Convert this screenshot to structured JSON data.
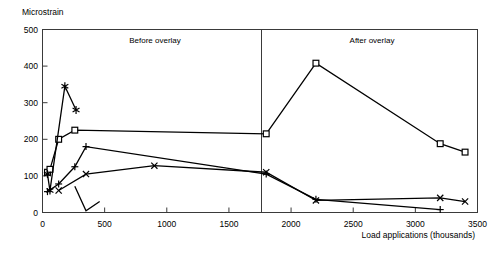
{
  "chart_data": {
    "type": "line",
    "title": "",
    "ylabel": "Microstrain",
    "xlabel": "Load applications (thousands)",
    "xlim": [
      0,
      3500
    ],
    "ylim": [
      0,
      500
    ],
    "xticks": [
      0,
      500,
      1000,
      1500,
      2000,
      2500,
      3000,
      3500
    ],
    "yticks": [
      0,
      100,
      200,
      300,
      400,
      500
    ],
    "grid": false,
    "legend": "none",
    "annotations": [
      {
        "text": "Before overlay",
        "x": 900,
        "y": 470
      },
      {
        "text": "After overlay",
        "x": 2650,
        "y": 470
      }
    ],
    "divider_x": 1800,
    "series": [
      {
        "name": "series-square",
        "marker": "square",
        "x": [
          40,
          60,
          130,
          260,
          1800,
          2200,
          3200,
          3400
        ],
        "y": [
          110,
          118,
          200,
          225,
          215,
          408,
          188,
          165
        ]
      },
      {
        "name": "series-asterisk",
        "marker": "asterisk",
        "x": [
          40,
          60,
          180,
          270
        ],
        "y": [
          105,
          60,
          345,
          280
        ]
      },
      {
        "name": "series-plus",
        "marker": "plus",
        "x": [
          40,
          130,
          260,
          350,
          1800,
          2200,
          3200
        ],
        "y": [
          57,
          78,
          125,
          180,
          105,
          36,
          8
        ]
      },
      {
        "name": "series-cross",
        "marker": "cross",
        "x": [
          130,
          350,
          900,
          1800,
          2200,
          3200,
          3400
        ],
        "y": [
          60,
          105,
          128,
          110,
          33,
          40,
          30
        ]
      },
      {
        "name": "series-unmarked-dip",
        "marker": "none",
        "x": [
          260,
          350,
          460
        ],
        "y": [
          72,
          5,
          30
        ]
      }
    ]
  },
  "yaxis": {
    "label": "Microstrain",
    "ticks": [
      "500",
      "400",
      "300",
      "200",
      "100",
      "0"
    ]
  },
  "xaxis": {
    "label": "Load applications (thousands)",
    "ticks": [
      "0",
      "500",
      "1000",
      "1500",
      "2000",
      "2500",
      "3000",
      "3500"
    ]
  },
  "panels": {
    "before": "Before overlay",
    "after": "After overlay"
  }
}
